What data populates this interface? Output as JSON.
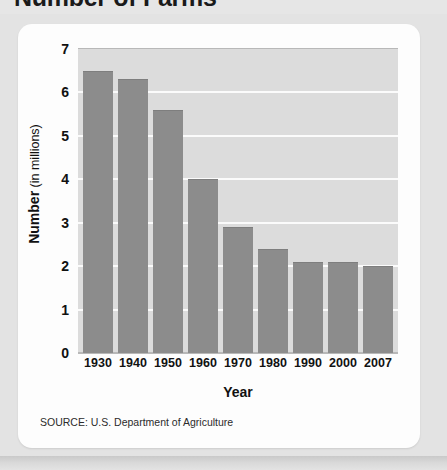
{
  "title": "Number of Farms",
  "source": "SOURCE: U.S. Department of Agriculture",
  "axis": {
    "ylabel_strong": "Number",
    "ylabel_light": " (in millions)",
    "xlabel": "Year"
  },
  "colors": {
    "page_background": "#e3e3e3",
    "card_background": "#fdfdfd",
    "plot_background": "#dcdcdc",
    "gridline": "#fbfbfb",
    "bar": "#8c8c8c",
    "text": "#111111"
  },
  "chart_data": {
    "type": "bar",
    "title": "Number of Farms",
    "xlabel": "Year",
    "ylabel": "Number (in millions)",
    "categories": [
      "1930",
      "1940",
      "1950",
      "1960",
      "1970",
      "1980",
      "1990",
      "2000",
      "2007"
    ],
    "values": [
      6.5,
      6.3,
      5.6,
      4.0,
      2.9,
      2.4,
      2.1,
      2.1,
      2.0
    ],
    "ylim": [
      0,
      7
    ],
    "yticks": [
      "0",
      "1",
      "2",
      "3",
      "4",
      "5",
      "6",
      "7"
    ],
    "grid": "horizontal",
    "legend": "none"
  }
}
